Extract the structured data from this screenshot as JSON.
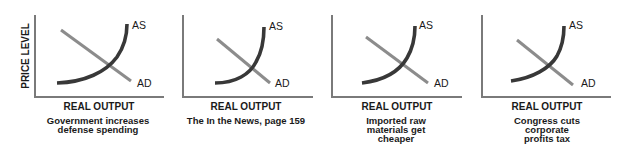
{
  "figure": {
    "y_axis_label": "PRICE LEVEL",
    "x_axis_label": "REAL OUTPUT",
    "colors": {
      "as_curve": "#383838",
      "ad_line": "#8c8c8c",
      "axis": "#7a7a7a",
      "text": "#1a1a1a",
      "background": "#ffffff"
    },
    "panels": [
      {
        "as_label": "AS",
        "ad_label": "AD",
        "caption_lines": [
          "Government increases",
          "defense spending"
        ]
      },
      {
        "as_label": "AS",
        "ad_label": "AD",
        "caption_lines": [
          "The In the News, page 159"
        ]
      },
      {
        "as_label": "AS",
        "ad_label": "AD",
        "caption_lines": [
          "Imported raw",
          "materials get",
          "cheaper"
        ]
      },
      {
        "as_label": "AS",
        "ad_label": "AD",
        "caption_lines": [
          "Congress cuts",
          "corporate",
          "profits tax"
        ]
      }
    ]
  }
}
